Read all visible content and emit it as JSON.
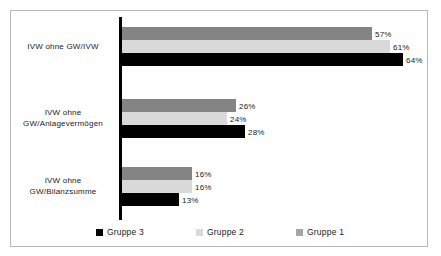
{
  "chart_data": {
    "type": "bar",
    "orientation": "horizontal",
    "title": "",
    "subtitle": "",
    "xlabel": "",
    "ylabel": "",
    "grid": false,
    "xlim": [
      0,
      64
    ],
    "axis_visible": "category-axis-only",
    "categories": [
      "IVW ohne GW/IVW",
      "IVW ohne GW/Anlagevermögen",
      "IVW ohne GW/Bilanzsumme"
    ],
    "category_label_lines": [
      [
        "IVW ohne GW/IVW"
      ],
      [
        "IVW ohne",
        "GW/Anlagevermögen"
      ],
      [
        "IVW ohne",
        "GW/Bilanzsumme"
      ]
    ],
    "series": [
      {
        "name": "Gruppe 1",
        "color": "#848484",
        "values": [
          57,
          26,
          16
        ],
        "labels": [
          "57%",
          "26%",
          "16%"
        ]
      },
      {
        "name": "Gruppe 2",
        "color": "#d9d9d9",
        "values": [
          61,
          24,
          16
        ],
        "labels": [
          "61%",
          "24%",
          "16%"
        ]
      },
      {
        "name": "Gruppe 3",
        "color": "#000000",
        "values": [
          64,
          28,
          13
        ],
        "labels": [
          "64%",
          "28%",
          "13%"
        ]
      }
    ],
    "legend": {
      "position": "bottom",
      "entries": [
        {
          "label": "Gruppe 3",
          "color": "#000000"
        },
        {
          "label": "Gruppe 2",
          "color": "#d9d9d9"
        },
        {
          "label": "Gruppe 1",
          "color": "#848484"
        }
      ]
    },
    "value_labels": {
      "group1": {
        "gruppe1": "57%",
        "gruppe2": "61%",
        "gruppe3": "64%"
      },
      "group2": {
        "gruppe1": "26%",
        "gruppe2": "24%",
        "gruppe3": "28%"
      },
      "group3": {
        "gruppe1": "16%",
        "gruppe2": "16%",
        "gruppe3": "13%"
      }
    }
  },
  "frame": {
    "border_color": "#b9b9b9",
    "background": "#ffffff"
  }
}
